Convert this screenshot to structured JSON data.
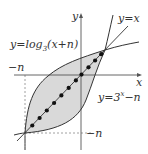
{
  "diagram": {
    "axes": {
      "x_label": "x",
      "y_label": "y"
    },
    "labels": {
      "identity_line": "y=x",
      "log_curve_prefix": "y=log",
      "log_curve_base": "3",
      "log_curve_arg": "(x+n)",
      "exp_curve_prefix": "y=3",
      "exp_curve_exp": "x",
      "exp_curve_suffix": "−n",
      "neg_n_x": "−n",
      "neg_n_y": "−n"
    },
    "colors": {
      "shade": "#d9d9d9",
      "line": "#333333",
      "dot": "#111111",
      "dashed": "#888888"
    },
    "lattice_dots": 11
  }
}
